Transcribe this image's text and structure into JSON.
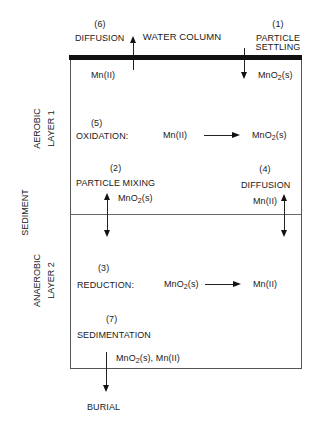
{
  "diagram": {
    "water_column_label": "WATER COLUMN",
    "sediment_label": "SEDIMENT",
    "layers": [
      {
        "name_line1": "AEROBIC",
        "name_line2": "LAYER 1"
      },
      {
        "name_line1": "ANAEROBIC",
        "name_line2": "LAYER 2"
      }
    ],
    "processes": {
      "p1": {
        "number": "(1)",
        "line1": "PARTICLE",
        "line2": "SETTLING",
        "species_base": "MnO",
        "species_sub": "2",
        "species_tail": "(s)",
        "direction": "down"
      },
      "p2": {
        "number": "(2)",
        "label": "PARTICLE MIXING",
        "species_base": "MnO",
        "species_sub": "2",
        "species_tail": "(s)",
        "direction": "both"
      },
      "p3": {
        "number": "(3)",
        "label": "REDUCTION:",
        "from_base": "MnO",
        "from_sub": "2",
        "from_tail": "(s)",
        "to": "Mn(II)"
      },
      "p4": {
        "number": "(4)",
        "label": "DIFFUSION",
        "species": "Mn(II)",
        "direction": "both"
      },
      "p5": {
        "number": "(5)",
        "label": "OXIDATION:",
        "from": "Mn(II)",
        "to_base": "MnO",
        "to_sub": "2",
        "to_tail": "(s)"
      },
      "p6": {
        "number": "(6)",
        "label": "DIFFUSION",
        "species": "Mn(II)",
        "direction": "up"
      },
      "p7": {
        "number": "(7)",
        "label": "SEDIMENTATION",
        "species_base": "MnO",
        "species_sub": "2",
        "species_tail": "(s),  Mn(II)",
        "direction": "down"
      }
    },
    "burial_label": "BURIAL"
  }
}
